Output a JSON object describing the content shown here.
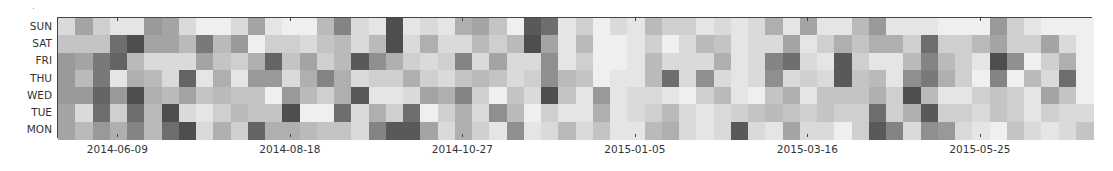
{
  "chart_data": {
    "type": "heatmap",
    "title": "",
    "xlabel": "",
    "ylabel": "",
    "colormap": "Greys",
    "value_range": [
      0,
      1
    ],
    "rows": [
      "SUN",
      "SAT",
      "FRI",
      "THU",
      "WED",
      "TUE",
      "MON"
    ],
    "n_columns": 60,
    "column_unit": "week",
    "first_column_week": "2014-05-19",
    "x_ticks": [
      {
        "label": "2014-06-09",
        "column": 3
      },
      {
        "label": "2014-08-18",
        "column": 13
      },
      {
        "label": "2014-10-27",
        "column": 23
      },
      {
        "label": "2015-01-05",
        "column": 33
      },
      {
        "label": "2015-03-16",
        "column": 43
      },
      {
        "label": "2015-05-25",
        "column": 53
      }
    ],
    "grid": false,
    "legend": null,
    "values": [
      [
        0.15,
        0.4,
        0.2,
        0.1,
        0.1,
        0.45,
        0.4,
        0.15,
        0.05,
        0.05,
        0.15,
        0.4,
        0.1,
        0.05,
        0.05,
        0.3,
        0.55,
        0.15,
        0.1,
        0.8,
        0.1,
        0.15,
        0.1,
        0.35,
        0.4,
        0.25,
        0.05,
        0.75,
        0.65,
        0.1,
        0.2,
        0.05,
        0.15,
        0.1,
        0.3,
        0.2,
        0.2,
        0.1,
        0.15,
        0.1,
        0.15,
        0.35,
        0.1,
        0.4,
        0.1,
        0.1,
        0.3,
        0.45,
        0.1,
        0.1,
        0.1,
        0.05,
        0.05,
        0.05,
        0.45,
        0.2,
        0.1,
        0.05,
        0.05,
        0.05
      ],
      [
        0.25,
        0.25,
        0.25,
        0.65,
        0.8,
        0.4,
        0.4,
        0.3,
        0.6,
        0.3,
        0.45,
        0.05,
        0.2,
        0.2,
        0.15,
        0.25,
        0.3,
        0.15,
        0.3,
        0.8,
        0.15,
        0.35,
        0.15,
        0.15,
        0.3,
        0.2,
        0.3,
        0.8,
        0.4,
        0.1,
        0.3,
        0.05,
        0.05,
        0.1,
        0.2,
        0.05,
        0.15,
        0.3,
        0.25,
        0.1,
        0.15,
        0.15,
        0.4,
        0.1,
        0.2,
        0.35,
        0.25,
        0.35,
        0.35,
        0.2,
        0.65,
        0.2,
        0.2,
        0.3,
        0.4,
        0.2,
        0.2,
        0.4,
        0.15,
        0.05
      ],
      [
        0.45,
        0.4,
        0.6,
        0.7,
        0.3,
        0.15,
        0.15,
        0.15,
        0.4,
        0.25,
        0.2,
        0.35,
        0.7,
        0.25,
        0.4,
        0.2,
        0.3,
        0.75,
        0.5,
        0.35,
        0.2,
        0.15,
        0.2,
        0.55,
        0.15,
        0.4,
        0.15,
        0.15,
        0.5,
        0.1,
        0.2,
        0.05,
        0.05,
        0.1,
        0.3,
        0.15,
        0.15,
        0.15,
        0.35,
        0.1,
        0.15,
        0.55,
        0.65,
        0.15,
        0.1,
        0.75,
        0.2,
        0.1,
        0.1,
        0.3,
        0.55,
        0.3,
        0.2,
        0.1,
        0.8,
        0.5,
        0.05,
        0.2,
        0.35,
        0.05
      ],
      [
        0.45,
        0.3,
        0.6,
        0.1,
        0.35,
        0.3,
        0.15,
        0.7,
        0.1,
        0.35,
        0.1,
        0.45,
        0.45,
        0.15,
        0.35,
        0.55,
        0.35,
        0.15,
        0.2,
        0.2,
        0.35,
        0.2,
        0.15,
        0.25,
        0.3,
        0.25,
        0.15,
        0.2,
        0.5,
        0.3,
        0.25,
        0.05,
        0.1,
        0.1,
        0.3,
        0.65,
        0.15,
        0.5,
        0.15,
        0.1,
        0.15,
        0.5,
        0.15,
        0.2,
        0.15,
        0.75,
        0.25,
        0.3,
        0.1,
        0.5,
        0.6,
        0.35,
        0.2,
        0.05,
        0.55,
        0.05,
        0.3,
        0.15,
        0.65,
        0.05
      ],
      [
        0.45,
        0.45,
        0.7,
        0.45,
        0.8,
        0.35,
        0.3,
        0.4,
        0.25,
        0.3,
        0.25,
        0.25,
        0.05,
        0.45,
        0.3,
        0.2,
        0.35,
        0.75,
        0.1,
        0.1,
        0.15,
        0.4,
        0.35,
        0.55,
        0.2,
        0.05,
        0.25,
        0.15,
        0.8,
        0.25,
        0.1,
        0.45,
        0.1,
        0.15,
        0.15,
        0.1,
        0.05,
        0.2,
        0.3,
        0.1,
        0.05,
        0.25,
        0.35,
        0.1,
        0.25,
        0.25,
        0.25,
        0.35,
        0.2,
        0.8,
        0.3,
        0.1,
        0.1,
        0.2,
        0.25,
        0.2,
        0.1,
        0.4,
        0.25,
        0.05
      ],
      [
        0.4,
        0.15,
        0.65,
        0.2,
        0.65,
        0.3,
        0.8,
        0.15,
        0.1,
        0.2,
        0.3,
        0.25,
        0.25,
        0.8,
        0.05,
        0.05,
        0.65,
        0.15,
        0.35,
        0.2,
        0.65,
        0.05,
        0.2,
        0.35,
        0.15,
        0.5,
        0.3,
        0.05,
        0.2,
        0.1,
        0.1,
        0.35,
        0.1,
        0.15,
        0.2,
        0.3,
        0.15,
        0.1,
        0.15,
        0.2,
        0.25,
        0.3,
        0.25,
        0.2,
        0.25,
        0.2,
        0.2,
        0.65,
        0.2,
        0.35,
        0.75,
        0.2,
        0.2,
        0.15,
        0.25,
        0.2,
        0.1,
        0.2,
        0.15,
        0.15
      ],
      [
        0.4,
        0.3,
        0.45,
        0.35,
        0.55,
        0.3,
        0.65,
        0.8,
        0.15,
        0.35,
        0.2,
        0.7,
        0.35,
        0.35,
        0.3,
        0.25,
        0.25,
        0.15,
        0.55,
        0.75,
        0.75,
        0.4,
        0.15,
        0.35,
        0.2,
        0.1,
        0.5,
        0.1,
        0.15,
        0.3,
        0.15,
        0.25,
        0.1,
        0.1,
        0.3,
        0.35,
        0.15,
        0.1,
        0.15,
        0.75,
        0.15,
        0.1,
        0.4,
        0.15,
        0.15,
        0.05,
        0.2,
        0.75,
        0.55,
        0.15,
        0.5,
        0.45,
        0.15,
        0.1,
        0.05,
        0.25,
        0.15,
        0.1,
        0.15,
        0.25
      ]
    ]
  }
}
